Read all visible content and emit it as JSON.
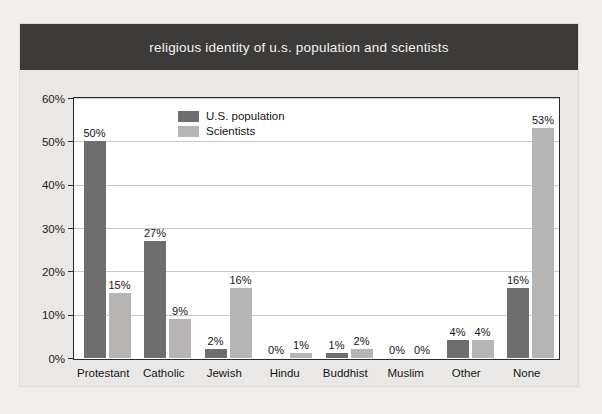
{
  "chart_data": {
    "type": "bar",
    "title": "religious identity of u.s. population and scientists",
    "xlabel": "",
    "ylabel": "",
    "ylim": [
      0,
      60
    ],
    "ytick_labels": [
      "0%",
      "10%",
      "20%",
      "30%",
      "40%",
      "50%",
      "60%"
    ],
    "ytick_values": [
      0,
      10,
      20,
      30,
      40,
      50,
      60
    ],
    "grid": true,
    "legend_position": "top-left-inside",
    "categories": [
      "Protestant",
      "Catholic",
      "Jewish",
      "Hindu",
      "Buddhist",
      "Muslim",
      "Other",
      "None"
    ],
    "series": [
      {
        "name": "U.S. population",
        "color": "#6f6e6e",
        "values": [
          50,
          27,
          2,
          0,
          1,
          0,
          4,
          16
        ],
        "data_labels": [
          "50%",
          "27%",
          "2%",
          "0%",
          "1%",
          "0%",
          "4%",
          "16%"
        ]
      },
      {
        "name": "Scientists",
        "color": "#b6b5b4",
        "values": [
          15,
          9,
          16,
          1,
          2,
          0,
          4,
          53
        ],
        "data_labels": [
          "15%",
          "9%",
          "16%",
          "1%",
          "2%",
          "0%",
          "4%",
          "53%"
        ]
      }
    ]
  },
  "banner": {
    "background": "#3c3b3a",
    "text_color": "#f3f2f0"
  },
  "card": {
    "background": "#e9e8e6",
    "plot_background": "#ffffff",
    "gridline_color": "#c9c9c9",
    "axis_color": "#2b2b2b"
  }
}
